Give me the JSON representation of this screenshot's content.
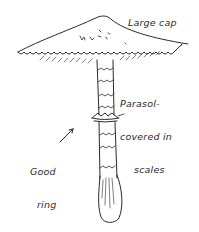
{
  "diagram": {
    "labels": {
      "cap": "Large cap",
      "parasol_line1": "Parasol-",
      "parasol_line2": "covered in",
      "parasol_line3": "scales",
      "ring_line1": "Good",
      "ring_line2": "ring"
    },
    "colors": {
      "ink": "#2a2a2a",
      "background": "#ffffff"
    }
  }
}
